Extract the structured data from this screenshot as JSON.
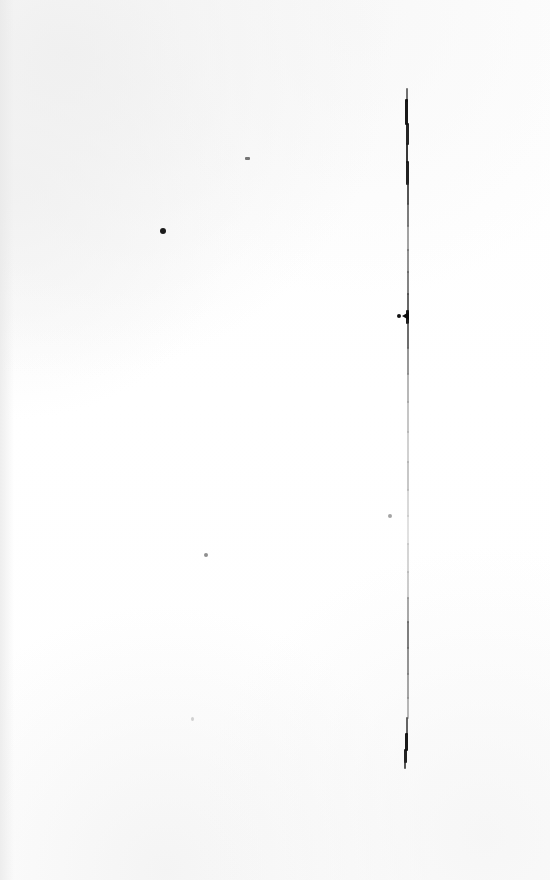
{
  "page": {
    "kind": "scanned-blank-page",
    "width": 550,
    "height": 880,
    "background_color": "#ffffff",
    "paper_tint_color": "#fdfdfd",
    "caption": "",
    "visible_text": ""
  },
  "ink": {
    "stroke_label": "vertical-ink-line",
    "stroke_color_dark": "#0a0a0a",
    "stroke_color_mid": "#555555",
    "stroke_color_light": "#9a9a9a",
    "stroke_color_faint": "#c2c2c2",
    "top_y": 88,
    "bottom_y": 768,
    "x_center": 407,
    "segments": [
      {
        "name": "top-tip",
        "x": 406,
        "y": 88,
        "w": 2,
        "h": 14,
        "color": "#3a3a3a",
        "opacity": 0.72
      },
      {
        "name": "upper-dark-1",
        "x": 405,
        "y": 99,
        "w": 3,
        "h": 26,
        "color": "#0d0d0d",
        "opacity": 0.95
      },
      {
        "name": "upper-dark-2",
        "x": 406,
        "y": 123,
        "w": 3,
        "h": 22,
        "color": "#121212",
        "opacity": 0.92
      },
      {
        "name": "upper-dark-3",
        "x": 406,
        "y": 143,
        "w": 2,
        "h": 20,
        "color": "#1c1c1c",
        "opacity": 0.88
      },
      {
        "name": "upper-dark-4",
        "x": 406,
        "y": 161,
        "w": 3,
        "h": 24,
        "color": "#101010",
        "opacity": 0.93
      },
      {
        "name": "upper-mid-1",
        "x": 407,
        "y": 183,
        "w": 2,
        "h": 22,
        "color": "#2e2e2e",
        "opacity": 0.82
      },
      {
        "name": "upper-mid-2",
        "x": 407,
        "y": 203,
        "w": 2,
        "h": 24,
        "color": "#4a4a4a",
        "opacity": 0.72
      },
      {
        "name": "mid-grey-1",
        "x": 407,
        "y": 225,
        "w": 2,
        "h": 26,
        "color": "#6b6b6b",
        "opacity": 0.62
      },
      {
        "name": "mid-grey-2",
        "x": 407,
        "y": 249,
        "w": 2,
        "h": 24,
        "color": "#5a5a5a",
        "opacity": 0.66
      },
      {
        "name": "mid-grey-3",
        "x": 407,
        "y": 271,
        "w": 2,
        "h": 24,
        "color": "#4e4e4e",
        "opacity": 0.7
      },
      {
        "name": "mid-grey-4",
        "x": 407,
        "y": 293,
        "w": 2,
        "h": 22,
        "color": "#3c3c3c",
        "opacity": 0.78
      },
      {
        "name": "blob-zone",
        "x": 406,
        "y": 310,
        "w": 3,
        "h": 14,
        "color": "#111111",
        "opacity": 0.95
      },
      {
        "name": "below-blob-1",
        "x": 407,
        "y": 323,
        "w": 2,
        "h": 26,
        "color": "#3f3f3f",
        "opacity": 0.76
      },
      {
        "name": "below-blob-2",
        "x": 407,
        "y": 347,
        "w": 2,
        "h": 28,
        "color": "#5e5e5e",
        "opacity": 0.64
      },
      {
        "name": "fade-1",
        "x": 407,
        "y": 373,
        "w": 2,
        "h": 30,
        "color": "#7e7e7e",
        "opacity": 0.55
      },
      {
        "name": "fade-2",
        "x": 407,
        "y": 401,
        "w": 2,
        "h": 32,
        "color": "#8d8d8d",
        "opacity": 0.5
      },
      {
        "name": "fade-3",
        "x": 407,
        "y": 431,
        "w": 2,
        "h": 32,
        "color": "#9a9a9a",
        "opacity": 0.46
      },
      {
        "name": "fade-4",
        "x": 407,
        "y": 461,
        "w": 2,
        "h": 30,
        "color": "#8f8f8f",
        "opacity": 0.5
      },
      {
        "name": "fade-5",
        "x": 407,
        "y": 489,
        "w": 2,
        "h": 28,
        "color": "#a4a4a4",
        "opacity": 0.42
      },
      {
        "name": "fade-6",
        "x": 407,
        "y": 515,
        "w": 2,
        "h": 30,
        "color": "#b0b0b0",
        "opacity": 0.38
      },
      {
        "name": "fade-7",
        "x": 407,
        "y": 543,
        "w": 2,
        "h": 30,
        "color": "#a0a0a0",
        "opacity": 0.44
      },
      {
        "name": "fade-8",
        "x": 407,
        "y": 571,
        "w": 2,
        "h": 28,
        "color": "#949494",
        "opacity": 0.48
      },
      {
        "name": "lower-grey-1",
        "x": 407,
        "y": 597,
        "w": 2,
        "h": 26,
        "color": "#6e6e6e",
        "opacity": 0.6
      },
      {
        "name": "lower-grey-2",
        "x": 407,
        "y": 621,
        "w": 2,
        "h": 28,
        "color": "#4d4d4d",
        "opacity": 0.72
      },
      {
        "name": "lower-grey-3",
        "x": 407,
        "y": 647,
        "w": 2,
        "h": 28,
        "color": "#5c5c5c",
        "opacity": 0.66
      },
      {
        "name": "lower-grey-4",
        "x": 407,
        "y": 673,
        "w": 2,
        "h": 26,
        "color": "#6a6a6a",
        "opacity": 0.6
      },
      {
        "name": "lower-grey-5",
        "x": 407,
        "y": 697,
        "w": 2,
        "h": 22,
        "color": "#7c7c7c",
        "opacity": 0.54
      },
      {
        "name": "lower-dark-1",
        "x": 406,
        "y": 717,
        "w": 2,
        "h": 18,
        "color": "#3a3a3a",
        "opacity": 0.78
      },
      {
        "name": "bottom-dark-1",
        "x": 405,
        "y": 733,
        "w": 3,
        "h": 18,
        "color": "#0e0e0e",
        "opacity": 0.95
      },
      {
        "name": "bottom-dark-2",
        "x": 404,
        "y": 749,
        "w": 3,
        "h": 14,
        "color": "#111111",
        "opacity": 0.93
      },
      {
        "name": "bottom-tip",
        "x": 404,
        "y": 761,
        "w": 2,
        "h": 8,
        "color": "#2b2b2b",
        "opacity": 0.8
      }
    ],
    "blob": {
      "name": "ink-blob-artifact",
      "dot_x": 397,
      "dot_y": 314,
      "dot_size": 4,
      "wedge_x": 402,
      "wedge_y": 312
    }
  },
  "specks": [
    {
      "name": "speck-upper-dash",
      "x": 245,
      "y": 157,
      "w": 5,
      "h": 3,
      "color": "#3d3d3d",
      "opacity": 0.7,
      "shape": "dash"
    },
    {
      "name": "speck-upper-dot",
      "x": 160,
      "y": 228,
      "w": 6,
      "h": 6,
      "color": "#0f0f0f",
      "opacity": 0.95,
      "shape": "dot"
    },
    {
      "name": "speck-mid-left",
      "x": 388,
      "y": 514,
      "w": 4,
      "h": 4,
      "color": "#5a5a5a",
      "opacity": 0.55,
      "shape": "dot"
    },
    {
      "name": "speck-mid-dot",
      "x": 204,
      "y": 553,
      "w": 4,
      "h": 4,
      "color": "#4a4a4a",
      "opacity": 0.62,
      "shape": "dot"
    },
    {
      "name": "speck-lower-faint",
      "x": 191,
      "y": 717,
      "w": 3,
      "h": 4,
      "color": "#9d9d9d",
      "opacity": 0.45,
      "shape": "dot"
    }
  ]
}
